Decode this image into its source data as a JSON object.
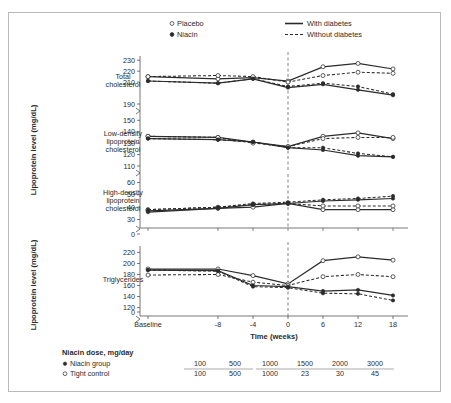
{
  "chart_data": {
    "type": "line",
    "title": "",
    "xlabel": "Time (weeks)",
    "ylabel": "Lipoprotein level (mg/dL)",
    "x": [
      "Baseline",
      -8,
      -4,
      0,
      6,
      12,
      18
    ],
    "xtick_labels": [
      "Baseline",
      "-8",
      "-4",
      "0",
      "6",
      "12",
      "18"
    ],
    "grid": false,
    "legend_position": "top",
    "annotations": [
      "dashed vertical reference line at week 0"
    ],
    "legend": [
      {
        "label": "Placebo",
        "marker": "open-circle"
      },
      {
        "label": "Niacin",
        "marker": "filled-circle"
      },
      {
        "label": "With diabetes",
        "line": "solid"
      },
      {
        "label": "Without diabetes",
        "line": "dashed"
      }
    ],
    "panels": [
      {
        "name": "total-cholesterol",
        "label": "Total\ncholesterol",
        "label_lines": [
          "Total",
          "cholesterol"
        ],
        "ylim": [
          190,
          232
        ],
        "yticks": [
          190,
          210,
          220,
          230
        ],
        "axis_break_below": 190,
        "series": [
          {
            "name": "Placebo, with diabetes",
            "marker": "open-circle",
            "line": "solid",
            "values": [
              215,
              213,
              214,
              211,
              224,
              227,
              222
            ]
          },
          {
            "name": "Placebo, without diabetes",
            "marker": "open-circle",
            "line": "dashed",
            "values": [
              215,
              216,
              215,
              210,
              216,
              219,
              218
            ]
          },
          {
            "name": "Niacin, with diabetes",
            "marker": "filled-circle",
            "line": "solid",
            "values": [
              211,
              209,
              213,
              205,
              208,
              203,
              198
            ]
          },
          {
            "name": "Niacin, without diabetes",
            "marker": "filled-circle",
            "line": "dashed",
            "values": [
              211,
              209,
              213,
              206,
              209,
              206,
              199
            ]
          }
        ]
      },
      {
        "name": "ldl-cholesterol",
        "label_lines": [
          "Low-density",
          "lipoprotein",
          "cholesterol"
        ],
        "ylim": [
          110,
          152
        ],
        "yticks": [
          110,
          120,
          130,
          140,
          150
        ],
        "axis_break_below": 110,
        "series": [
          {
            "name": "Placebo, with diabetes",
            "marker": "open-circle",
            "line": "solid",
            "values": [
              136,
              135,
              131,
              127,
              136,
              139,
              134
            ]
          },
          {
            "name": "Placebo, without diabetes",
            "marker": "open-circle",
            "line": "dashed",
            "values": [
              136,
              135,
              130,
              127,
              134,
              135,
              135
            ]
          },
          {
            "name": "Niacin, with diabetes",
            "marker": "filled-circle",
            "line": "solid",
            "values": [
              134,
              133,
              131,
              126,
              124,
              119,
              118
            ]
          },
          {
            "name": "Niacin, without diabetes",
            "marker": "filled-circle",
            "line": "dashed",
            "values": [
              134,
              133,
              131,
              126,
              126,
              121,
              118
            ]
          }
        ]
      },
      {
        "name": "hdl-cholesterol",
        "label_lines": [
          "High-density",
          "lipoprotein",
          "cholesterol"
        ],
        "ylim": [
          28,
          62
        ],
        "yticks": [
          30,
          40,
          50,
          60
        ],
        "axis_break_below": 30,
        "zero_tick": 0,
        "series": [
          {
            "name": "Placebo, with diabetes",
            "marker": "open-circle",
            "line": "solid",
            "values": [
              37,
              39,
              40,
              43,
              38,
              38,
              38
            ]
          },
          {
            "name": "Placebo, without diabetes",
            "marker": "open-circle",
            "line": "dashed",
            "values": [
              38,
              40,
              42,
              43,
              41,
              41,
              41
            ]
          },
          {
            "name": "Niacin, with diabetes",
            "marker": "filled-circle",
            "line": "solid",
            "values": [
              36,
              39,
              42,
              43,
              45,
              46,
              47
            ]
          },
          {
            "name": "Niacin, without diabetes",
            "marker": "filled-circle",
            "line": "dashed",
            "values": [
              38,
              40,
              43,
              44,
              46,
              47,
              49
            ]
          }
        ]
      },
      {
        "name": "triglycerides",
        "label_lines": [
          "Triglycerides"
        ],
        "ylim": [
          112,
          228
        ],
        "yticks": [
          120,
          140,
          160,
          180,
          200,
          220
        ],
        "axis_break_below": 120,
        "zero_tick": 0,
        "series": [
          {
            "name": "Placebo, with diabetes",
            "marker": "open-circle",
            "line": "solid",
            "values": [
              190,
              190,
              178,
              163,
              205,
              212,
              206
            ]
          },
          {
            "name": "Placebo, without diabetes",
            "marker": "open-circle",
            "line": "dashed",
            "values": [
              179,
              180,
              166,
              160,
              176,
              180,
              176
            ]
          },
          {
            "name": "Niacin, with diabetes",
            "marker": "filled-circle",
            "line": "solid",
            "values": [
              188,
              187,
              160,
              158,
              150,
              152,
              142
            ]
          },
          {
            "name": "Niacin, without diabetes",
            "marker": "filled-circle",
            "line": "dashed",
            "values": [
              188,
              186,
              158,
              156,
              146,
              145,
              133
            ]
          }
        ]
      }
    ],
    "dose_table": {
      "title": "Niacin dose, mg/day",
      "rows": [
        {
          "label": "Niacin group",
          "marker": "filled-circle",
          "values": [
            "100",
            "500",
            "1000",
            "1500",
            "2000",
            "3000"
          ]
        },
        {
          "label": "Tight control",
          "marker": "open-circle",
          "values": [
            "100",
            "500",
            "1000",
            "23",
            "30",
            "45"
          ]
        }
      ]
    }
  },
  "colors": {
    "line": "#2b2b2b",
    "axis": "#555555",
    "text": "#2b2b2b",
    "frame": "#b9b9b9",
    "reference_line": "#777777"
  }
}
